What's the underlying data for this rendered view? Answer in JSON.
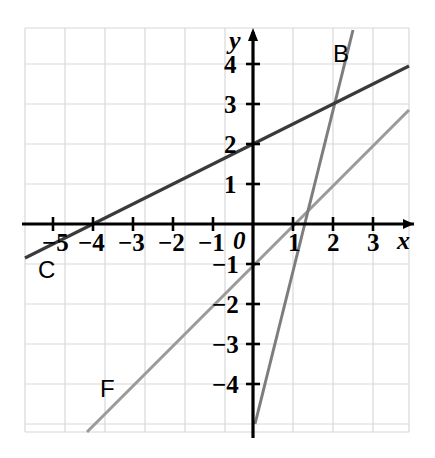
{
  "chart_data": {
    "type": "line",
    "title": "",
    "xlabel": "x",
    "ylabel": "y",
    "xlim": [
      -5.7,
      3.9
    ],
    "ylim": [
      -5.2,
      4.9
    ],
    "grid": true,
    "grid_spacing": 1,
    "legend": "inline-labels",
    "origin_label": "0",
    "xticks": [
      -5,
      -4,
      -3,
      -2,
      -1,
      1,
      2,
      3
    ],
    "xtick_labels": [
      "−5",
      "−4",
      "−3",
      "−2",
      "−1",
      "1",
      "2",
      "3"
    ],
    "yticks": [
      4,
      3,
      2,
      1,
      -1,
      -2,
      -3,
      -4
    ],
    "ytick_labels": [
      "4",
      "3",
      "2",
      "1",
      "−1",
      "−2",
      "−3",
      "−4"
    ],
    "series": [
      {
        "name": "C",
        "label": "C",
        "color": "#3a3a3a",
        "width": 3.2,
        "slope": 0.5,
        "intercept": 2,
        "equation": "y = 0.5x + 2",
        "x_intercept": -4,
        "y_intercept": 2,
        "points": [
          [
            -5.7,
            -0.85
          ],
          [
            3.9,
            3.95
          ]
        ],
        "label_x": -4.9,
        "label_y": -1.15
      },
      {
        "name": "B",
        "label": "B",
        "color": "#7d7d7d",
        "width": 3.0,
        "slope": 4,
        "intercept": -5.2,
        "equation": "y = 4x − 5.2",
        "x_intercept": 1.3,
        "y_intercept": -5.2,
        "points": [
          [
            0.05,
            -5.0
          ],
          [
            2.5,
            4.85
          ]
        ],
        "label_x": 2.05,
        "label_y": 4.25
      },
      {
        "name": "F",
        "label": "F",
        "color": "#9a9a9a",
        "width": 3.0,
        "slope": 1,
        "intercept": -1,
        "equation": "y = x − 1",
        "x_intercept": 1,
        "y_intercept": -1,
        "points": [
          [
            -4.15,
            -5.2
          ],
          [
            3.9,
            2.85
          ]
        ],
        "label_x": -3.65,
        "label_y": -4.05
      }
    ]
  },
  "axes": {
    "x_axis_label": "x",
    "y_axis_label": "y",
    "origin_label": "0"
  },
  "labels": {
    "x_neg5": "−5",
    "x_neg4": "−4",
    "x_neg3": "−3",
    "x_neg2": "−2",
    "x_neg1": "−1",
    "x_pos1": "1",
    "x_pos2": "2",
    "x_pos3": "3",
    "y_pos4": "4",
    "y_pos3": "3",
    "y_pos2": "2",
    "y_pos1": "1",
    "y_neg1": "−1",
    "y_neg2": "−2",
    "y_neg3": "−3",
    "y_neg4": "−4",
    "line_b": "B",
    "line_c": "C",
    "line_f": "F"
  },
  "colors": {
    "grid": "#d8d8d8",
    "axis": "#000000",
    "line_c": "#3a3a3a",
    "line_b": "#7d7d7d",
    "line_f": "#9a9a9a",
    "background": "#ffffff"
  }
}
